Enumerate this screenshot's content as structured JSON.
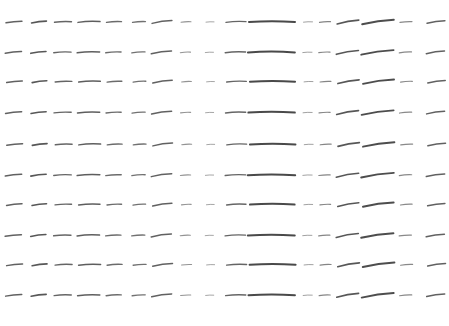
{
  "canvas": {
    "width": 449,
    "height": 326,
    "background_color": "#ffffff",
    "stroke_color": "#3a3a3a",
    "stroke_color_light": "#8a8a8a",
    "title": "",
    "description": "stroke-glyph-grid"
  },
  "chart_data": {
    "type": "scatter",
    "title": "",
    "subtitle": "",
    "xlabel": "",
    "ylabel": "",
    "grid": false,
    "legend": null,
    "xlim": [
      0,
      449
    ],
    "ylim": [
      0,
      326
    ],
    "row_count": 10,
    "column_count": 17,
    "row_y": [
      22,
      52,
      82,
      112,
      145,
      175,
      205,
      235,
      265,
      295
    ],
    "column_profiles": [
      {
        "index": 0,
        "x": 14,
        "length": 16,
        "angle": -6,
        "weight": 1.5,
        "opacity": 0.8
      },
      {
        "index": 1,
        "x": 39,
        "length": 15,
        "angle": -7,
        "weight": 1.6,
        "opacity": 0.85
      },
      {
        "index": 2,
        "x": 63,
        "length": 17,
        "angle": -2,
        "weight": 1.4,
        "opacity": 0.78
      },
      {
        "index": 3,
        "x": 89,
        "length": 22,
        "angle": -2,
        "weight": 1.5,
        "opacity": 0.82
      },
      {
        "index": 4,
        "x": 114,
        "length": 15,
        "angle": -3,
        "weight": 1.4,
        "opacity": 0.75
      },
      {
        "index": 5,
        "x": 139,
        "length": 13,
        "angle": -4,
        "weight": 1.3,
        "opacity": 0.72
      },
      {
        "index": 6,
        "x": 162,
        "length": 20,
        "angle": -8,
        "weight": 1.5,
        "opacity": 0.8
      },
      {
        "index": 7,
        "x": 186,
        "length": 10,
        "angle": -3,
        "weight": 1.1,
        "opacity": 0.55
      },
      {
        "index": 8,
        "x": 210,
        "length": 8,
        "angle": -2,
        "weight": 1.0,
        "opacity": 0.45
      },
      {
        "index": 9,
        "x": 236,
        "length": 20,
        "angle": -2,
        "weight": 1.4,
        "opacity": 0.78
      },
      {
        "index": 10,
        "x": 272,
        "length": 46,
        "angle": 0,
        "weight": 2.0,
        "opacity": 0.92
      },
      {
        "index": 11,
        "x": 308,
        "length": 9,
        "angle": -2,
        "weight": 1.0,
        "opacity": 0.48
      },
      {
        "index": 12,
        "x": 325,
        "length": 11,
        "angle": -3,
        "weight": 1.2,
        "opacity": 0.62
      },
      {
        "index": 13,
        "x": 348,
        "length": 22,
        "angle": -10,
        "weight": 1.6,
        "opacity": 0.85
      },
      {
        "index": 14,
        "x": 378,
        "length": 32,
        "angle": -8,
        "weight": 1.9,
        "opacity": 0.9
      },
      {
        "index": 15,
        "x": 406,
        "length": 12,
        "angle": -4,
        "weight": 1.2,
        "opacity": 0.6
      },
      {
        "index": 16,
        "x": 436,
        "length": 18,
        "angle": -8,
        "weight": 1.5,
        "opacity": 0.8
      }
    ],
    "row_jitter": [
      {
        "row": 0,
        "dy": 0,
        "dx": 0,
        "scale": 1.0
      },
      {
        "row": 1,
        "dy": 0.4,
        "dx": -0.6,
        "scale": 1.02
      },
      {
        "row": 2,
        "dy": -0.3,
        "dx": 0.5,
        "scale": 0.98
      },
      {
        "row": 3,
        "dy": 0.6,
        "dx": -0.4,
        "scale": 1.01
      },
      {
        "row": 4,
        "dy": -0.5,
        "dx": 0.7,
        "scale": 0.99
      },
      {
        "row": 5,
        "dy": 0.2,
        "dx": -0.5,
        "scale": 1.03
      },
      {
        "row": 6,
        "dy": -0.4,
        "dx": 0.3,
        "scale": 0.97
      },
      {
        "row": 7,
        "dy": 0.5,
        "dx": -0.7,
        "scale": 1.02
      },
      {
        "row": 8,
        "dy": -0.2,
        "dx": 0.6,
        "scale": 1.0
      },
      {
        "row": 9,
        "dy": 0.3,
        "dx": -0.3,
        "scale": 1.01
      }
    ]
  }
}
